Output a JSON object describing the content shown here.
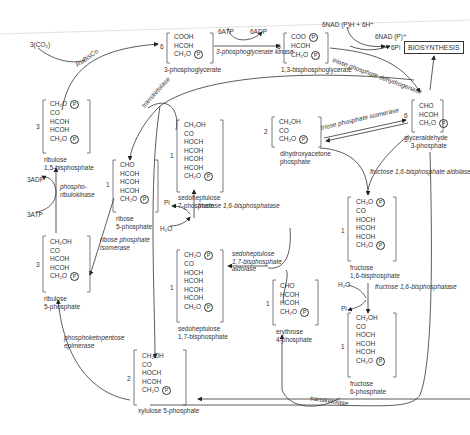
{
  "diagram": {
    "inputs": {
      "co2": "3(CO₂)"
    },
    "enzymes": {
      "rubisco": "RuBisCo",
      "pgk": "3-phosphoglycerate kinase",
      "tpd": "triose phosphate dehydrogenase",
      "tpi": "triose phosphate isomerase",
      "fba": "fructose 1,6-bisphosphate aldolase",
      "fbpase1": "fructose 1,6-bisphosphatase",
      "fbpase2": "fructose 1,6-bisphosphatase",
      "sba_1": "sedoheptulose",
      "sba_2": "1,7-bisphosphate",
      "sba_3": "aldolase",
      "tk1": "transketolase",
      "tk2": "transketolase",
      "rpi_1": "ribose phosphate",
      "rpi_2": "isomerase",
      "prk_1": "phospho-",
      "prk_2": "ribulokinase",
      "rpe_1": "phosphoketopentose",
      "rpe_2": "epimerase"
    },
    "cofactors": {
      "atp6": "6ATP",
      "adp6": "6ADP",
      "nadph": "6NAD (P)H + 6H⁺",
      "nadp": "6NAD (P)⁺",
      "pi6": "6Pi",
      "adp3": "3ADP",
      "atp3": "3ATP",
      "h2o_a": "H₂O",
      "pi_a": "Pi",
      "h2o_b": "H₂O",
      "pi_b": "Pi"
    },
    "output_box": "BIOSYNTHESIS",
    "molecules": {
      "pg3": {
        "coef": "6",
        "rows": [
          "COOH",
          "HCOH",
          "CH₂O"
        ],
        "p_rows": [
          2
        ],
        "name_1": "3-phosphoglycerate"
      },
      "bpg": {
        "coef": "6",
        "rows": [
          "COO",
          "HCOH",
          "CH₂O"
        ],
        "p_rows": [
          0,
          2
        ],
        "name_1": "1,3-bisphosphoglycerate"
      },
      "g3p": {
        "coef": "6",
        "rows": [
          "CHO",
          "HCOH",
          "CH₂O"
        ],
        "p_rows": [
          2
        ],
        "name_1": "glyceraldehyde",
        "name_2": "3-phosphate"
      },
      "dhap": {
        "coef": "2",
        "rows": [
          "CH₂OH",
          "CO",
          "CH₂O"
        ],
        "p_rows": [
          2
        ],
        "name_1": "dihydroxyacetone",
        "name_2": "phosphate"
      },
      "rubp": {
        "coef": "3",
        "rows": [
          "CH₂O",
          "CO",
          "HCOH",
          "HCOH",
          "CH₂O"
        ],
        "p_rows": [
          0,
          4
        ],
        "name_1": "ribulose",
        "name_2": "1,5-bisphosphate"
      },
      "r5p": {
        "coef": "1",
        "rows": [
          "CHO",
          "HCOH",
          "HCOH",
          "HCOH",
          "CH₂O"
        ],
        "p_rows": [
          4
        ],
        "name_1": "ribose",
        "name_2": "5-phosphate"
      },
      "ru5p": {
        "coef": "3",
        "rows": [
          "CH₂OH",
          "CO",
          "HCOH",
          "HCOH",
          "CH₂O"
        ],
        "p_rows": [
          4
        ],
        "name_1": "ribulose",
        "name_2": "5-phosphate"
      },
      "s7p": {
        "coef": "1",
        "rows": [
          "CH₂OH",
          "CO",
          "HOCH",
          "HCOH",
          "HCOH",
          "HCOH",
          "CH₂O"
        ],
        "p_rows": [
          6
        ],
        "name_1": "sedoheptulose",
        "name_2": "7-phosphate"
      },
      "sbp": {
        "coef": "1",
        "rows": [
          "CH₂O",
          "CO",
          "HOCH",
          "HCOH",
          "HCOH",
          "HCOH",
          "CH₂O"
        ],
        "p_rows": [
          0,
          6
        ],
        "name_1": "sedoheptulose",
        "name_2": "1,7-bisphosphate"
      },
      "e4p": {
        "coef": "1",
        "rows": [
          "CHO",
          "HCOH",
          "HCOH",
          "CH₂O"
        ],
        "p_rows": [
          3
        ],
        "name_1": "erythrose",
        "name_2": "4-phosphate"
      },
      "fbp": {
        "coef": "1",
        "rows": [
          "CH₂O",
          "CO",
          "HOCH",
          "HCOH",
          "HCOH",
          "CH₂O"
        ],
        "p_rows": [
          0,
          5
        ],
        "name_1": "fructose",
        "name_2": "1,6-bisphosphate"
      },
      "f6p": {
        "coef": "1",
        "rows": [
          "CH₂OH",
          "CO",
          "HOCH",
          "HCOH",
          "HCOH",
          "CH₂O"
        ],
        "p_rows": [
          5
        ],
        "name_1": "fructose",
        "name_2": "6-phosphate"
      },
      "xu5p": {
        "coef": "2",
        "rows": [
          "CH₂OH",
          "CO",
          "HOCH",
          "HCOH",
          "CH₂O"
        ],
        "p_rows": [
          4
        ],
        "name_1": "xylulose 5-phosphate"
      }
    },
    "phosphate_symbol": "P"
  }
}
